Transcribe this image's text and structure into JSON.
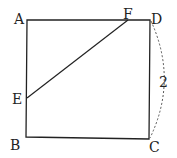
{
  "diagram": {
    "type": "geometry-square",
    "points": {
      "A": {
        "label": "A"
      },
      "B": {
        "label": "B"
      },
      "C": {
        "label": "C"
      },
      "D": {
        "label": "D"
      },
      "E": {
        "label": "E"
      },
      "F": {
        "label": "F"
      }
    },
    "segments": [
      "AB",
      "BC",
      "CD",
      "DA",
      "EF"
    ],
    "arc": {
      "from": "D",
      "to": "C",
      "style": "dashed",
      "label": "2"
    },
    "colors": {
      "line": "#222222",
      "background": "#ffffff"
    }
  }
}
